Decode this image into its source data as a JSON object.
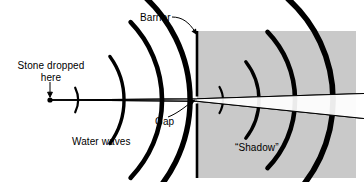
{
  "figure": {
    "background_color": "#ffffff",
    "ink_color": "#000000",
    "shadow_fill_color": "#c9c9c9",
    "width": 364,
    "height": 182
  },
  "labels": {
    "stone_dropped": "Stone dropped\nhere",
    "stone_dropped_line1": "Stone dropped",
    "stone_dropped_line2": "here",
    "barrier": "Barrier",
    "gap": "Gap",
    "water_waves": "Water waves",
    "shadow": "“Shadow”"
  },
  "elements": {
    "stone_point": {
      "name": "stone-impact-point",
      "x": 50,
      "y": 100,
      "radius": 2.6
    },
    "barrier": {
      "name": "barrier-wall",
      "x": 197,
      "y_top": 31,
      "y_bottom": 178,
      "gap_y_top": 96,
      "gap_y_bottom": 104,
      "thickness": 3
    },
    "shadow_region": {
      "name": "shadow-shaded-area",
      "x_left": 197,
      "x_right": 356,
      "y_top": 31,
      "y_bottom": 178,
      "fill": "#c9c9c9"
    },
    "rays": [
      {
        "name": "ray-upper",
        "from": [
          50,
          100
        ],
        "through_gap": [
          197,
          99
        ],
        "to": [
          364,
          94
        ]
      },
      {
        "name": "ray-lower",
        "from": [
          50,
          100
        ],
        "through_gap": [
          197,
          101
        ],
        "to": [
          364,
          118
        ]
      }
    ]
  },
  "incoming_waves": {
    "name": "incident-circular-wavefronts",
    "center": [
      50,
      100
    ],
    "count": 4,
    "radii": [
      28,
      74,
      112,
      140
    ],
    "arc_half_angle_deg": [
      26,
      36,
      44,
      50
    ],
    "stroke_widths": [
      2.2,
      3.4,
      4.4,
      5.2
    ]
  },
  "diffracted_waves": {
    "name": "diffracted-circular-wavefronts",
    "center": [
      197,
      100
    ],
    "count": 4,
    "radii": [
      26,
      62,
      98,
      136
    ],
    "arc_half_angle_deg": [
      30,
      38,
      44,
      48
    ],
    "stroke_widths": [
      2.2,
      3.4,
      4.4,
      5.4
    ]
  },
  "leaders": {
    "barrier_leader": {
      "name": "barrier-leader-line",
      "from": [
        175,
        17
      ],
      "to": [
        196,
        33
      ]
    },
    "gap_leader": {
      "name": "gap-leader-arrow",
      "from": [
        172,
        114
      ],
      "to": [
        194,
        100
      ]
    },
    "stone_leader": {
      "name": "stone-leader-arrow",
      "from": [
        50,
        84
      ],
      "to": [
        50,
        96
      ]
    }
  }
}
